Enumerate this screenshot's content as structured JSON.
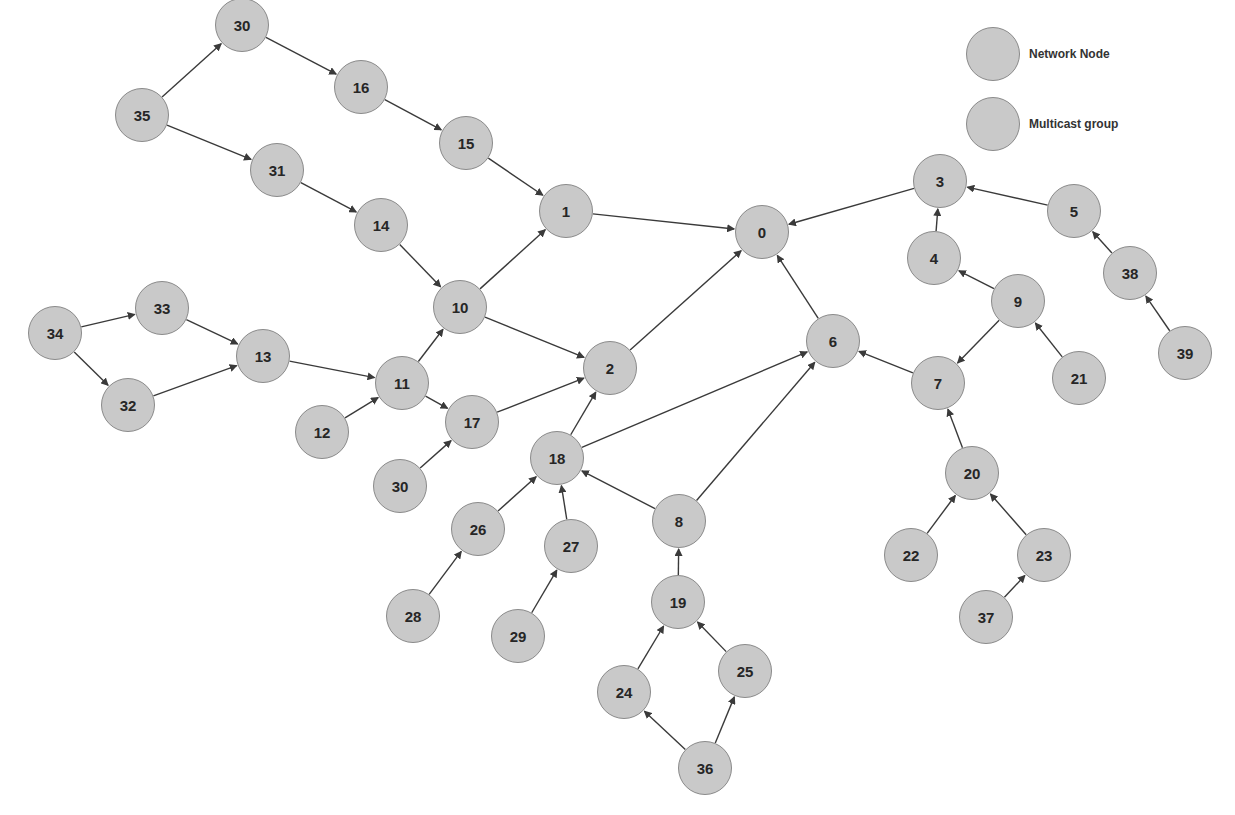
{
  "legend": {
    "items": [
      {
        "label": "Network Node",
        "color": "#c9c9c9",
        "x": 966,
        "y": 27
      },
      {
        "label": "Multicast group",
        "color": "#c9c9c9",
        "x": 966,
        "y": 97
      }
    ]
  },
  "style": {
    "node_fill": "#c9c9c9",
    "node_stroke": "#8a8a8a",
    "edge_color": "#3a3a3a",
    "node_radius": 27
  },
  "nodes": [
    {
      "id": "n30a",
      "label": "30",
      "x": 242,
      "y": 25
    },
    {
      "id": "n16",
      "label": "16",
      "x": 361,
      "y": 87
    },
    {
      "id": "n35",
      "label": "35",
      "x": 142,
      "y": 115
    },
    {
      "id": "n15",
      "label": "15",
      "x": 466,
      "y": 143
    },
    {
      "id": "n31",
      "label": "31",
      "x": 277,
      "y": 170
    },
    {
      "id": "n1",
      "label": "1",
      "x": 566,
      "y": 211
    },
    {
      "id": "n14",
      "label": "14",
      "x": 381,
      "y": 225
    },
    {
      "id": "n0",
      "label": "0",
      "x": 762,
      "y": 232
    },
    {
      "id": "n3",
      "label": "3",
      "x": 940,
      "y": 181
    },
    {
      "id": "n5",
      "label": "5",
      "x": 1074,
      "y": 211
    },
    {
      "id": "n4",
      "label": "4",
      "x": 934,
      "y": 258
    },
    {
      "id": "n10",
      "label": "10",
      "x": 460,
      "y": 307
    },
    {
      "id": "n9",
      "label": "9",
      "x": 1018,
      "y": 301
    },
    {
      "id": "n38",
      "label": "38",
      "x": 1130,
      "y": 273
    },
    {
      "id": "n34",
      "label": "34",
      "x": 55,
      "y": 333
    },
    {
      "id": "n33",
      "label": "33",
      "x": 162,
      "y": 308
    },
    {
      "id": "n13",
      "label": "13",
      "x": 263,
      "y": 356
    },
    {
      "id": "n6",
      "label": "6",
      "x": 833,
      "y": 341
    },
    {
      "id": "n2",
      "label": "2",
      "x": 610,
      "y": 368
    },
    {
      "id": "n11",
      "label": "11",
      "x": 402,
      "y": 383
    },
    {
      "id": "n7",
      "label": "7",
      "x": 938,
      "y": 383
    },
    {
      "id": "n21",
      "label": "21",
      "x": 1079,
      "y": 378
    },
    {
      "id": "n39",
      "label": "39",
      "x": 1185,
      "y": 353
    },
    {
      "id": "n32",
      "label": "32",
      "x": 128,
      "y": 405
    },
    {
      "id": "n12",
      "label": "12",
      "x": 322,
      "y": 432
    },
    {
      "id": "n17",
      "label": "17",
      "x": 472,
      "y": 422
    },
    {
      "id": "n18",
      "label": "18",
      "x": 557,
      "y": 458
    },
    {
      "id": "n20",
      "label": "20",
      "x": 972,
      "y": 473
    },
    {
      "id": "n30b",
      "label": "30",
      "x": 400,
      "y": 486
    },
    {
      "id": "n8",
      "label": "8",
      "x": 679,
      "y": 521
    },
    {
      "id": "n26",
      "label": "26",
      "x": 478,
      "y": 529
    },
    {
      "id": "n27",
      "label": "27",
      "x": 571,
      "y": 546
    },
    {
      "id": "n22",
      "label": "22",
      "x": 911,
      "y": 555
    },
    {
      "id": "n23",
      "label": "23",
      "x": 1044,
      "y": 555
    },
    {
      "id": "n19",
      "label": "19",
      "x": 678,
      "y": 602
    },
    {
      "id": "n28",
      "label": "28",
      "x": 413,
      "y": 616
    },
    {
      "id": "n29",
      "label": "29",
      "x": 518,
      "y": 636
    },
    {
      "id": "n37",
      "label": "37",
      "x": 986,
      "y": 617
    },
    {
      "id": "n25",
      "label": "25",
      "x": 745,
      "y": 671
    },
    {
      "id": "n24",
      "label": "24",
      "x": 624,
      "y": 692
    },
    {
      "id": "n36",
      "label": "36",
      "x": 705,
      "y": 768
    }
  ],
  "edges": [
    {
      "from": "n35",
      "to": "n30a"
    },
    {
      "from": "n30a",
      "to": "n16"
    },
    {
      "from": "n16",
      "to": "n15"
    },
    {
      "from": "n15",
      "to": "n1"
    },
    {
      "from": "n35",
      "to": "n31"
    },
    {
      "from": "n31",
      "to": "n14"
    },
    {
      "from": "n14",
      "to": "n10"
    },
    {
      "from": "n10",
      "to": "n1"
    },
    {
      "from": "n1",
      "to": "n0"
    },
    {
      "from": "n10",
      "to": "n2"
    },
    {
      "from": "n2",
      "to": "n0"
    },
    {
      "from": "n34",
      "to": "n33"
    },
    {
      "from": "n34",
      "to": "n32"
    },
    {
      "from": "n33",
      "to": "n13"
    },
    {
      "from": "n32",
      "to": "n13"
    },
    {
      "from": "n13",
      "to": "n11"
    },
    {
      "from": "n11",
      "to": "n10"
    },
    {
      "from": "n12",
      "to": "n11"
    },
    {
      "from": "n11",
      "to": "n17"
    },
    {
      "from": "n30b",
      "to": "n17"
    },
    {
      "from": "n17",
      "to": "n2"
    },
    {
      "from": "n18",
      "to": "n2"
    },
    {
      "from": "n18",
      "to": "n6"
    },
    {
      "from": "n26",
      "to": "n18"
    },
    {
      "from": "n28",
      "to": "n26"
    },
    {
      "from": "n27",
      "to": "n18"
    },
    {
      "from": "n29",
      "to": "n27"
    },
    {
      "from": "n8",
      "to": "n18"
    },
    {
      "from": "n8",
      "to": "n6"
    },
    {
      "from": "n19",
      "to": "n8"
    },
    {
      "from": "n24",
      "to": "n19"
    },
    {
      "from": "n25",
      "to": "n19"
    },
    {
      "from": "n36",
      "to": "n24"
    },
    {
      "from": "n36",
      "to": "n25"
    },
    {
      "from": "n6",
      "to": "n0"
    },
    {
      "from": "n3",
      "to": "n0"
    },
    {
      "from": "n4",
      "to": "n3"
    },
    {
      "from": "n5",
      "to": "n3"
    },
    {
      "from": "n38",
      "to": "n5"
    },
    {
      "from": "n39",
      "to": "n38"
    },
    {
      "from": "n9",
      "to": "n4"
    },
    {
      "from": "n9",
      "to": "n7"
    },
    {
      "from": "n21",
      "to": "n9"
    },
    {
      "from": "n7",
      "to": "n6"
    },
    {
      "from": "n20",
      "to": "n7"
    },
    {
      "from": "n22",
      "to": "n20"
    },
    {
      "from": "n23",
      "to": "n20"
    },
    {
      "from": "n37",
      "to": "n23"
    }
  ]
}
